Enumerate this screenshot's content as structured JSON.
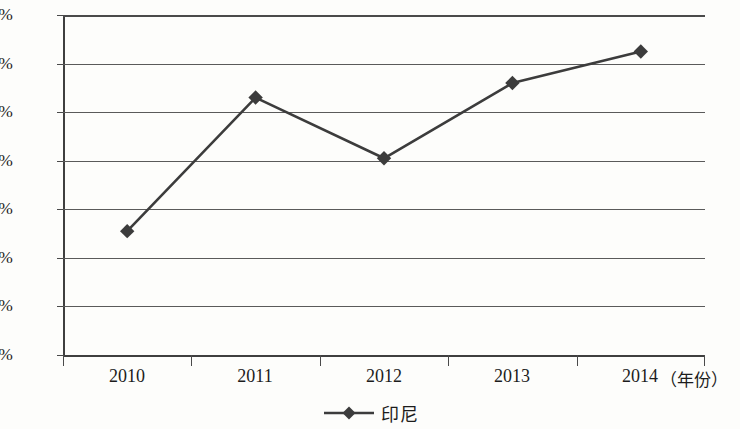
{
  "chart_data": {
    "type": "line",
    "title": "",
    "subtitle": "",
    "xlabel": "（年份）",
    "ylabel": "",
    "categories": [
      "2010",
      "2011",
      "2012",
      "2013",
      "2014"
    ],
    "x": [
      2010,
      2011,
      2012,
      2013,
      2014
    ],
    "series": [
      {
        "name": "印尼",
        "values": [
          5.1,
          10.6,
          8.1,
          11.2,
          12.5
        ],
        "marker": "diamond",
        "color": "#3c3c3c"
      }
    ],
    "y_tick_labels": [
      "14%",
      "12%",
      "10%",
      "8%",
      "6%",
      "4%",
      "2%",
      "0%"
    ],
    "y_tick_values": [
      14,
      12,
      10,
      8,
      6,
      4,
      2,
      0
    ],
    "ylim": [
      0,
      14
    ],
    "y_unit": "%",
    "grid": "horizontal",
    "legend_position": "bottom-center",
    "legend_entries": [
      "印尼"
    ],
    "annotations": []
  },
  "axes": {
    "x_axis_unit_label": "（年份）",
    "x_tick_labels": [
      "2010",
      "2011",
      "2012",
      "2013",
      "2014"
    ],
    "y_tick_labels": [
      "14%",
      "12%",
      "10%",
      "8%",
      "6%",
      "4%",
      "2%",
      "0%"
    ]
  },
  "legend": {
    "entries": [
      {
        "label": "印尼",
        "color": "#3c3c3c",
        "marker": "diamond"
      }
    ]
  },
  "style": {
    "background": "#fdfdfb",
    "line_color": "#3c3c3c",
    "grid_color": "#5a5a5a",
    "axis_color": "#3f3f3f",
    "text_color": "#1c1c1c"
  }
}
